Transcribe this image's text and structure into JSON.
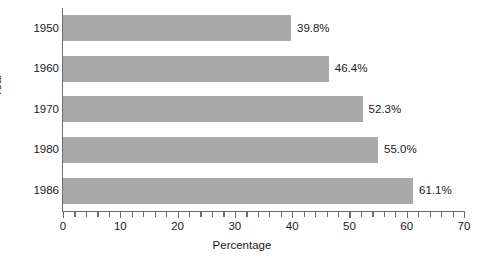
{
  "chart_data": {
    "type": "bar",
    "orientation": "horizontal",
    "title": "",
    "xlabel": "Percentage",
    "ylabel": "Year",
    "categories": [
      "1950",
      "1960",
      "1970",
      "1980",
      "1986"
    ],
    "values": [
      39.8,
      46.4,
      52.3,
      55.0,
      61.1
    ],
    "value_labels": [
      "39.8%",
      "46.4%",
      "52.3%",
      "55.0%",
      "61.1%"
    ],
    "xlim": [
      0,
      70
    ],
    "ylim_categories": 5,
    "x_major_ticks": [
      0,
      10,
      20,
      30,
      40,
      50,
      60,
      70
    ],
    "x_major_tick_labels": [
      "0",
      "10",
      "20",
      "30",
      "40",
      "50",
      "60",
      "70"
    ],
    "x_minor_tick_interval": 2,
    "grid": false,
    "legend": null,
    "bar_color": "#a9a9a9",
    "axis_color": "#6b6b6b",
    "text_color": "#1a1a1a",
    "background_color": "#ffffff"
  }
}
